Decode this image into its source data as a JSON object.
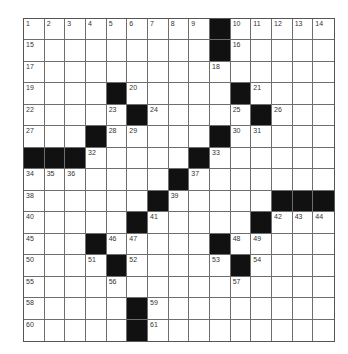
{
  "puzzle": {
    "rows": 15,
    "cols": 15,
    "colors": {
      "black_square": "#111111",
      "white_square": "#ffffff",
      "grid_line": "#6e6e6e"
    },
    "layout": [
      ".........#.....",
      ".........#.....",
      "...............",
      "....#.....#....",
      ".....#.....#...",
      "...#.....#.....",
      "###.....#......",
      ".......#.......",
      "......#.....###",
      ".....#.....#...",
      "...#.....#.....",
      "....#.....#....",
      "...............",
      ".....#.........",
      ".....#........."
    ],
    "numbers": [
      {
        "r": 0,
        "c": 0,
        "n": "1"
      },
      {
        "r": 0,
        "c": 1,
        "n": "2"
      },
      {
        "r": 0,
        "c": 2,
        "n": "3"
      },
      {
        "r": 0,
        "c": 3,
        "n": "4"
      },
      {
        "r": 0,
        "c": 4,
        "n": "5"
      },
      {
        "r": 0,
        "c": 5,
        "n": "6"
      },
      {
        "r": 0,
        "c": 6,
        "n": "7"
      },
      {
        "r": 0,
        "c": 7,
        "n": "8"
      },
      {
        "r": 0,
        "c": 8,
        "n": "9"
      },
      {
        "r": 0,
        "c": 10,
        "n": "10"
      },
      {
        "r": 0,
        "c": 11,
        "n": "11"
      },
      {
        "r": 0,
        "c": 12,
        "n": "12"
      },
      {
        "r": 0,
        "c": 13,
        "n": "13"
      },
      {
        "r": 0,
        "c": 14,
        "n": "14"
      },
      {
        "r": 1,
        "c": 0,
        "n": "15"
      },
      {
        "r": 1,
        "c": 10,
        "n": "16"
      },
      {
        "r": 2,
        "c": 0,
        "n": "17"
      },
      {
        "r": 2,
        "c": 9,
        "n": "18"
      },
      {
        "r": 3,
        "c": 0,
        "n": "19"
      },
      {
        "r": 3,
        "c": 5,
        "n": "20"
      },
      {
        "r": 3,
        "c": 11,
        "n": "21"
      },
      {
        "r": 4,
        "c": 0,
        "n": "22"
      },
      {
        "r": 4,
        "c": 4,
        "n": "23"
      },
      {
        "r": 4,
        "c": 6,
        "n": "24"
      },
      {
        "r": 4,
        "c": 10,
        "n": "25"
      },
      {
        "r": 4,
        "c": 12,
        "n": "26"
      },
      {
        "r": 5,
        "c": 0,
        "n": "27"
      },
      {
        "r": 5,
        "c": 4,
        "n": "28"
      },
      {
        "r": 5,
        "c": 5,
        "n": "29"
      },
      {
        "r": 5,
        "c": 10,
        "n": "30"
      },
      {
        "r": 5,
        "c": 11,
        "n": "31"
      },
      {
        "r": 6,
        "c": 3,
        "n": "32"
      },
      {
        "r": 6,
        "c": 9,
        "n": "33"
      },
      {
        "r": 7,
        "c": 0,
        "n": "34"
      },
      {
        "r": 7,
        "c": 1,
        "n": "35"
      },
      {
        "r": 7,
        "c": 2,
        "n": "36"
      },
      {
        "r": 7,
        "c": 8,
        "n": "37"
      },
      {
        "r": 8,
        "c": 0,
        "n": "38"
      },
      {
        "r": 8,
        "c": 7,
        "n": "39"
      },
      {
        "r": 9,
        "c": 0,
        "n": "40"
      },
      {
        "r": 9,
        "c": 6,
        "n": "41"
      },
      {
        "r": 9,
        "c": 12,
        "n": "42"
      },
      {
        "r": 9,
        "c": 13,
        "n": "43"
      },
      {
        "r": 9,
        "c": 14,
        "n": "44"
      },
      {
        "r": 10,
        "c": 0,
        "n": "45"
      },
      {
        "r": 10,
        "c": 4,
        "n": "46"
      },
      {
        "r": 10,
        "c": 5,
        "n": "47"
      },
      {
        "r": 10,
        "c": 10,
        "n": "48"
      },
      {
        "r": 10,
        "c": 11,
        "n": "49"
      },
      {
        "r": 11,
        "c": 0,
        "n": "50"
      },
      {
        "r": 11,
        "c": 3,
        "n": "51"
      },
      {
        "r": 11,
        "c": 5,
        "n": "52"
      },
      {
        "r": 11,
        "c": 9,
        "n": "53"
      },
      {
        "r": 11,
        "c": 11,
        "n": "54"
      },
      {
        "r": 12,
        "c": 0,
        "n": "55"
      },
      {
        "r": 12,
        "c": 4,
        "n": "56"
      },
      {
        "r": 12,
        "c": 10,
        "n": "57"
      },
      {
        "r": 13,
        "c": 0,
        "n": "58"
      },
      {
        "r": 13,
        "c": 6,
        "n": "59"
      },
      {
        "r": 14,
        "c": 0,
        "n": "60"
      },
      {
        "r": 14,
        "c": 6,
        "n": "61"
      }
    ]
  }
}
